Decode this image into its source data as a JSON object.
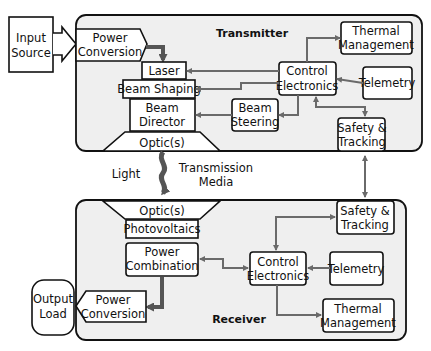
{
  "transmitter": {
    "label": "Transmitter",
    "input_source": [
      "Input",
      "Source"
    ],
    "power_conversion": [
      "Power",
      "Conversion"
    ],
    "laser": "Laser",
    "beam_shaping": "Beam Shaping",
    "beam_director": [
      "Beam",
      "Director"
    ],
    "optics": "Optic(s)",
    "control_electronics": [
      "Control",
      "Electronics"
    ],
    "thermal_management": [
      "Thermal",
      "Management"
    ],
    "telemetry": "Telemetry",
    "beam_steering": [
      "Beam",
      "Steering"
    ],
    "safety_tracking": [
      "Safety &",
      "Tracking"
    ]
  },
  "link": {
    "light": "Light",
    "transmission_media": [
      "Transmission",
      "Media"
    ]
  },
  "receiver": {
    "label": "Receiver",
    "optics": "Optic(s)",
    "photovoltaics": "Photovoltaics",
    "power_combination": [
      "Power",
      "Combination"
    ],
    "power_conversion": [
      "Power",
      "Conversion"
    ],
    "output_load": [
      "Output",
      "Load"
    ],
    "control_electronics": [
      "Control",
      "Electronics"
    ],
    "telemetry": "Telemetry",
    "thermal_management": [
      "Thermal",
      "Management"
    ],
    "safety_tracking": [
      "Safety &",
      "Tracking"
    ]
  },
  "colors": {
    "panel_fill": "#efefef",
    "connector": "#6a6a6a",
    "outline": "#111111"
  }
}
